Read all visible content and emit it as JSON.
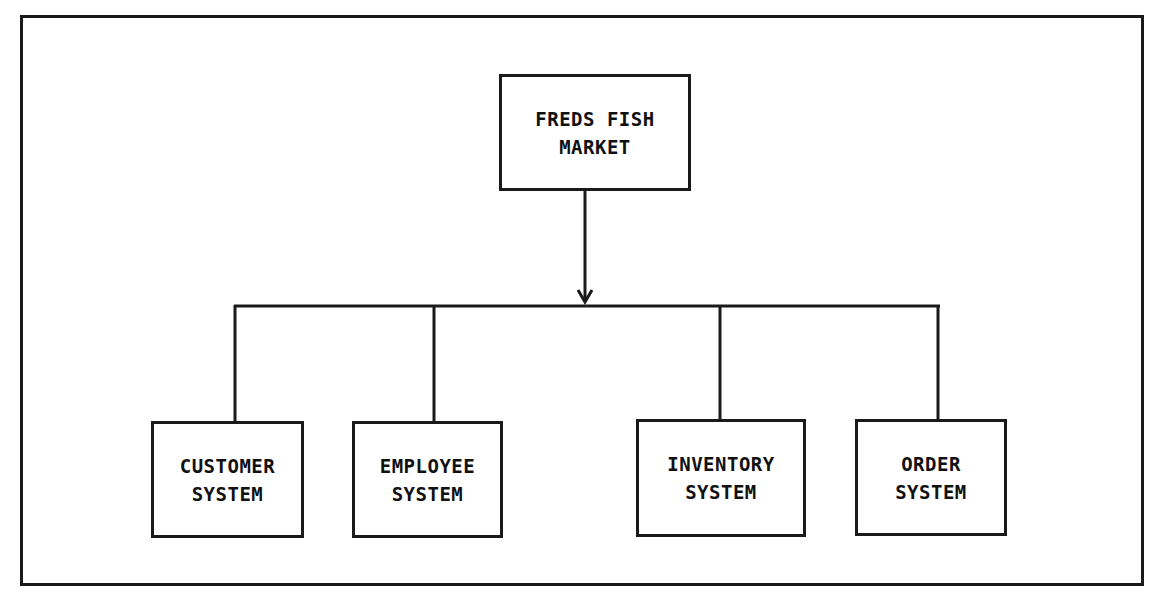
{
  "diagram": {
    "type": "hierarchy",
    "root": {
      "id": "root",
      "lines": [
        "FREDS FISH",
        "MARKET"
      ]
    },
    "children": [
      {
        "id": "customer",
        "lines": [
          "CUSTOMER",
          "SYSTEM"
        ]
      },
      {
        "id": "employee",
        "lines": [
          "EMPLOYEE",
          "SYSTEM"
        ]
      },
      {
        "id": "inventory",
        "lines": [
          "INVENTORY",
          "SYSTEM"
        ]
      },
      {
        "id": "order",
        "lines": [
          "ORDER",
          "SYSTEM"
        ]
      }
    ],
    "edges": [
      {
        "from": "root",
        "to": "branch-bus",
        "arrow": true
      }
    ],
    "colors": {
      "stroke": "#1a1a1a",
      "background": "#ffffff"
    }
  }
}
